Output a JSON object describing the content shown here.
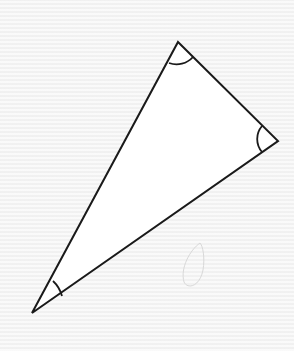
{
  "diagram": {
    "type": "triangle",
    "background": "#f4f4f4",
    "stroke_color": "#1a1a1a",
    "fill_color": "#ffffff",
    "vertices": [
      {
        "id": "top",
        "x": 178,
        "y": 42
      },
      {
        "id": "right",
        "x": 278,
        "y": 141
      },
      {
        "id": "bottom-left",
        "x": 32,
        "y": 313
      }
    ],
    "angle_marks": [
      {
        "vertex": "top",
        "style": "single-arc"
      },
      {
        "vertex": "right",
        "style": "single-arc"
      },
      {
        "vertex": "bottom-left",
        "style": "single-arc"
      }
    ],
    "labels": []
  }
}
